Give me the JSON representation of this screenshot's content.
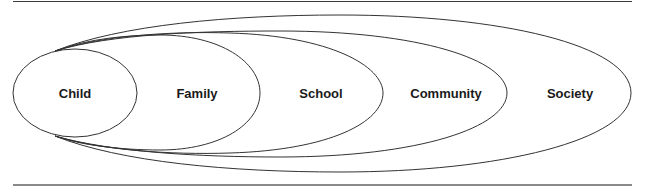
{
  "diagram": {
    "title": "",
    "levels": [
      {
        "label": "Child",
        "x": 75,
        "y": 93
      },
      {
        "label": "Family",
        "x": 197,
        "y": 93
      },
      {
        "label": "School",
        "x": 321,
        "y": 93
      },
      {
        "label": "Community",
        "x": 446,
        "y": 93
      },
      {
        "label": "Society",
        "x": 570,
        "y": 93
      }
    ],
    "colors": {
      "stroke": "#333333",
      "text": "#1a1a1a",
      "background": "#ffffff"
    }
  }
}
